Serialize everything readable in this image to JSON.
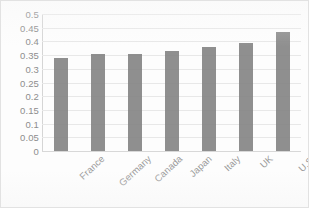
{
  "chart_data": {
    "type": "bar",
    "title": "",
    "subtitle": "",
    "xlabel": "",
    "ylabel": "",
    "categories": [
      "France",
      "Germany",
      "Canada",
      "Japan",
      "Italy",
      "UK",
      "U.S."
    ],
    "values": [
      0.34,
      0.355,
      0.355,
      0.365,
      0.38,
      0.395,
      0.435
    ],
    "series": [
      {
        "name": "",
        "values": [
          0.34,
          0.355,
          0.355,
          0.365,
          0.38,
          0.395,
          0.435
        ]
      }
    ],
    "ylim": [
      0,
      0.5
    ],
    "ytick_labels": [
      "0.5",
      "0.45",
      "0.4",
      "0.35",
      "0.3",
      "0.25",
      "0.2",
      "0.15",
      "0.1",
      "0.05",
      "0"
    ],
    "ytick_values": [
      0.5,
      0.45,
      0.4,
      0.35,
      0.3,
      0.25,
      0.2,
      0.15,
      0.1,
      0.05,
      0
    ],
    "ytick_step": 0.05,
    "grid": true,
    "grid_axis": "y",
    "legend": false,
    "legend_position": "none",
    "bar_color": "#808080",
    "gridline_color": "#e8e8e8",
    "axis_label_color": "#8d8d8d",
    "plot_background": "#ffffff",
    "xtick_rotation_degrees": -43,
    "annotations": []
  }
}
